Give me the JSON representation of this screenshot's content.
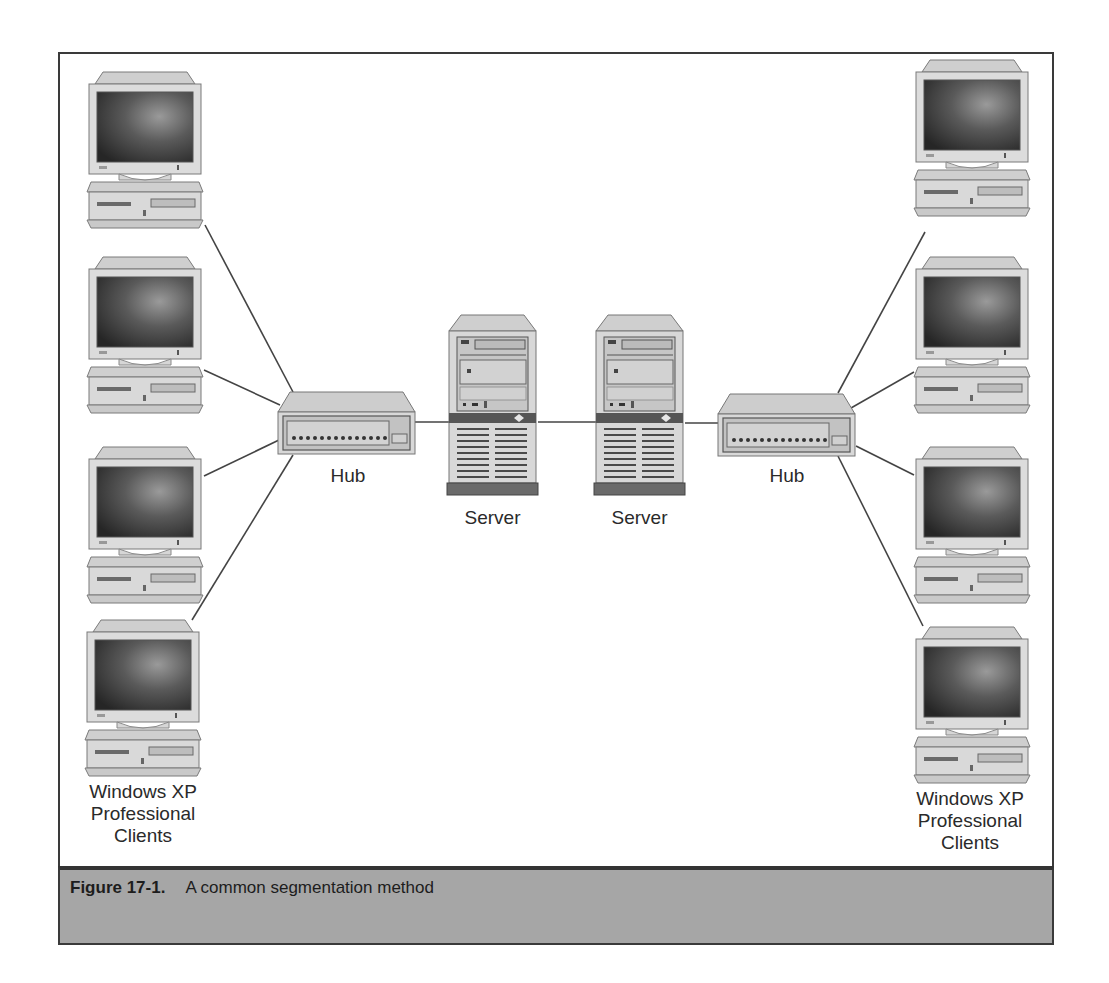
{
  "figure": {
    "number": "Figure 17-1.",
    "title": "A common segmentation method"
  },
  "nodes": {
    "hub_left": {
      "label": "Hub",
      "type": "hub-icon"
    },
    "hub_right": {
      "label": "Hub",
      "type": "hub-icon"
    },
    "server_left": {
      "label": "Server",
      "type": "server-icon"
    },
    "server_right": {
      "label": "Server",
      "type": "server-icon"
    },
    "clients_left": {
      "label_lines": [
        "Windows XP",
        "Professional",
        "Clients"
      ],
      "count": 4,
      "type": "desktop-computer-icon"
    },
    "clients_right": {
      "label_lines": [
        "Windows XP",
        "Professional",
        "Clients"
      ],
      "count": 4,
      "type": "desktop-computer-icon"
    }
  },
  "connections": [
    {
      "from": "client_left_1",
      "to": "hub_left"
    },
    {
      "from": "client_left_2",
      "to": "hub_left"
    },
    {
      "from": "client_left_3",
      "to": "hub_left"
    },
    {
      "from": "client_left_4",
      "to": "hub_left"
    },
    {
      "from": "hub_left",
      "to": "server_left"
    },
    {
      "from": "server_left",
      "to": "server_right"
    },
    {
      "from": "server_right",
      "to": "hub_right"
    },
    {
      "from": "hub_right",
      "to": "client_right_1"
    },
    {
      "from": "hub_right",
      "to": "client_right_2"
    },
    {
      "from": "hub_right",
      "to": "client_right_3"
    },
    {
      "from": "hub_right",
      "to": "client_right_4"
    }
  ],
  "colors": {
    "frame": "#3a3a3a",
    "caption_bg": "#a6a6a6",
    "device_body": "#d4d4d4",
    "screen_dark": "#3c3c3c",
    "line": "#444444"
  }
}
